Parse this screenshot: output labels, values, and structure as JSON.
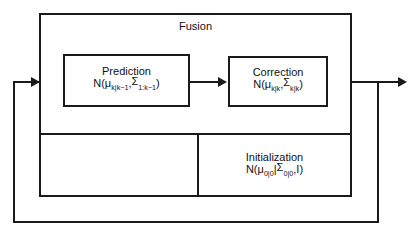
{
  "diagram": {
    "outer": {
      "label": "Fusion"
    },
    "blocks": [
      {
        "id": "prediction",
        "title": "Prediction",
        "formula_prefix": "N(",
        "mu": "μ",
        "mu_sub": "k|k−1",
        "comma1": ",",
        "sigma": "Σ",
        "sigma_sub": "1:k−1",
        "formula_suffix": ")",
        "formula_plain": "N(μ_k|k−1, Σ_1:k−1)"
      },
      {
        "id": "correction",
        "title": "Correction",
        "formula_prefix": "N(",
        "mu": "μ",
        "mu_sub": "k|k",
        "comma1": ",",
        "sigma": "Σ",
        "sigma_sub": "k|k",
        "formula_suffix": ")",
        "formula_plain": "N(μ_k|k, Σ_k|k)"
      },
      {
        "id": "initialization",
        "title": "Initialization",
        "formula_prefix": "N(",
        "mu": "μ",
        "mu_sub": "0|0",
        "comma1": "|",
        "sigma": "Σ",
        "sigma_sub": "0|0",
        "formula_suffix": ",I)",
        "formula_plain": "N(μ_0|0 |Σ_0|0, I)"
      }
    ],
    "connectors": [
      {
        "id": "input-arrow",
        "name": "feedback-input-arrow"
      },
      {
        "id": "pred-to-corr",
        "name": "prediction-to-correction-arrow"
      },
      {
        "id": "output-arrow",
        "name": "output-arrow"
      },
      {
        "id": "feedback-loop",
        "name": "feedback-loop-path"
      }
    ],
    "colors": {
      "line": "#1a1a1a",
      "background": "#ffffff",
      "text": "#111111"
    }
  }
}
